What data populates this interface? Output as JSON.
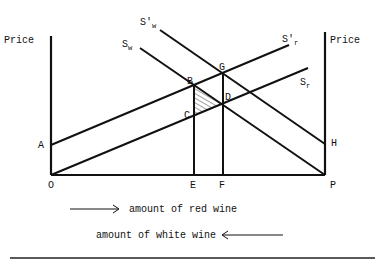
{
  "diagram": {
    "axes": {
      "left_label": "Price",
      "right_label": "Price"
    },
    "curves": {
      "s_w_prime": {
        "main": "S'",
        "sub": "w"
      },
      "s_w": {
        "main": "S",
        "sub": "w"
      },
      "s_r_prime": {
        "main": "S'",
        "sub": "r"
      },
      "s_r": {
        "main": "S",
        "sub": "r"
      }
    },
    "points": {
      "A": "A",
      "B": "B",
      "C": "C",
      "D": "D",
      "G": "G",
      "H": "H",
      "O": "O",
      "E": "E",
      "F": "F",
      "P": "P"
    },
    "legend": {
      "red_wine": "amount of red wine",
      "white_wine": "amount of white wine"
    },
    "colors": {
      "ink": "#111111",
      "background": "#ffffff"
    }
  }
}
